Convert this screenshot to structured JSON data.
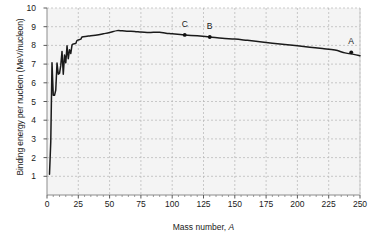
{
  "chart_data": {
    "type": "line",
    "title": "",
    "xlabel": "Mass number, A",
    "ylabel": "Binding energy per nucleon (MeV/nucleon)",
    "xlim": [
      0,
      250
    ],
    "ylim": [
      0,
      10
    ],
    "xticks": [
      0,
      25,
      50,
      75,
      100,
      125,
      150,
      175,
      200,
      225,
      250
    ],
    "xtick_labels": [
      "0",
      "25",
      "50",
      "75",
      "100",
      "125",
      "150",
      "175",
      "200",
      "225",
      "250"
    ],
    "yticks": [
      1,
      2,
      3,
      4,
      5,
      6,
      7,
      8,
      9,
      10
    ],
    "ytick_labels": [
      "1",
      "2",
      "3",
      "4",
      "5",
      "6",
      "7",
      "8",
      "9",
      "10"
    ],
    "grid": true,
    "grid_style": "dashed",
    "legend": "none",
    "series": [
      {
        "name": "Binding energy per nucleon",
        "x": [
          2,
          3,
          4,
          5,
          6,
          7,
          8,
          9,
          10,
          11,
          12,
          13,
          14,
          15,
          16,
          17,
          18,
          19,
          20,
          23,
          24,
          27,
          28,
          32,
          35,
          40,
          45,
          50,
          56,
          60,
          65,
          70,
          75,
          80,
          85,
          90,
          95,
          100,
          110,
          120,
          130,
          140,
          150,
          160,
          170,
          180,
          190,
          200,
          210,
          220,
          230,
          238,
          245,
          250
        ],
        "y": [
          1.11,
          2.83,
          7.07,
          5.33,
          5.33,
          5.61,
          7.06,
          6.46,
          6.5,
          6.93,
          7.68,
          6.46,
          7.48,
          7.07,
          7.98,
          7.29,
          7.77,
          7.57,
          8.03,
          8.11,
          8.26,
          8.33,
          8.45,
          8.49,
          8.52,
          8.55,
          8.62,
          8.69,
          8.79,
          8.78,
          8.76,
          8.75,
          8.71,
          8.69,
          8.7,
          8.7,
          8.65,
          8.62,
          8.56,
          8.51,
          8.45,
          8.38,
          8.34,
          8.27,
          8.2,
          8.12,
          8.05,
          7.98,
          7.9,
          7.83,
          7.75,
          7.6,
          7.52,
          7.45
        ]
      }
    ],
    "annotations": [
      {
        "label": "C",
        "x": 110,
        "y": 8.56
      },
      {
        "label": "B",
        "x": 130,
        "y": 8.45
      },
      {
        "label": "A",
        "x": 243,
        "y": 7.63
      }
    ],
    "colors": {
      "line": "#1a1a1a",
      "grid": "#b4b4b4",
      "axis": "#808080",
      "plot_background": "#f4f4f4",
      "page_background": "#ffffff",
      "text": "#1a1a1a"
    }
  }
}
